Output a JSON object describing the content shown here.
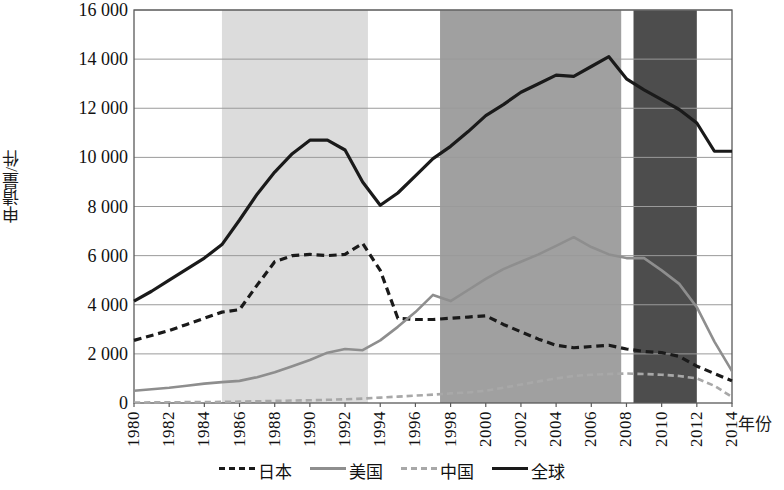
{
  "chart_data": {
    "type": "line",
    "title": "",
    "xlabel": "年份",
    "ylabel": "申请量/件",
    "xlim": [
      1980,
      2014
    ],
    "ylim": [
      0,
      16000
    ],
    "grid": true,
    "legend_position": "bottom",
    "ytick_labels": [
      "16 000",
      "14 000",
      "12 000",
      "10 000",
      "8 000",
      "6 000",
      "4 000",
      "2 000",
      "0"
    ],
    "ytick_values": [
      16000,
      14000,
      12000,
      10000,
      8000,
      6000,
      4000,
      2000,
      0
    ],
    "xtick_labels": [
      "1980",
      "1982",
      "1984",
      "1986",
      "1988",
      "1990",
      "1992",
      "1994",
      "1996",
      "1998",
      "2000",
      "2002",
      "2004",
      "2006",
      "2008",
      "2010",
      "2012",
      "2014"
    ],
    "xtick_values": [
      1980,
      1982,
      1984,
      1986,
      1988,
      1990,
      1992,
      1994,
      1996,
      1998,
      2000,
      2002,
      2004,
      2006,
      2008,
      2010,
      2012,
      2014
    ],
    "x": [
      1980,
      1981,
      1982,
      1983,
      1984,
      1985,
      1986,
      1987,
      1988,
      1989,
      1990,
      1991,
      1992,
      1993,
      1994,
      1995,
      1996,
      1997,
      1998,
      1999,
      2000,
      2001,
      2002,
      2003,
      2004,
      2005,
      2006,
      2007,
      2008,
      2009,
      2010,
      2011,
      2012,
      2013,
      2014
    ],
    "series": [
      {
        "name": "全球",
        "label": "全球",
        "style": "solid",
        "color": "#1a1a1a",
        "width": 3.2,
        "values": [
          4150,
          4550,
          5000,
          5450,
          5900,
          6450,
          7450,
          8500,
          9400,
          10150,
          10700,
          10700,
          10300,
          9000,
          8050,
          8550,
          9250,
          9950,
          10450,
          11050,
          11700,
          12150,
          12650,
          13000,
          13350,
          13300,
          13700,
          14100,
          13200,
          12750,
          12350,
          11950,
          11400,
          10250,
          10250
        ]
      },
      {
        "name": "日本",
        "label": "日本",
        "style": "dashed",
        "color": "#1a1a1a",
        "width": 3.2,
        "values": [
          2550,
          2750,
          2950,
          3200,
          3450,
          3700,
          3800,
          4800,
          5750,
          6000,
          6050,
          6000,
          6050,
          6500,
          5400,
          3450,
          3400,
          3400,
          3450,
          3500,
          3550,
          3200,
          2900,
          2600,
          2350,
          2250,
          2300,
          2350,
          2200,
          2100,
          2050,
          1900,
          1500,
          1200,
          900
        ]
      },
      {
        "name": "美国",
        "label": "美国",
        "style": "solid",
        "color": "#8e8e8e",
        "width": 2.6,
        "values": [
          500,
          560,
          620,
          700,
          790,
          850,
          900,
          1050,
          1250,
          1500,
          1750,
          2050,
          2200,
          2150,
          2550,
          3100,
          3700,
          4400,
          4150,
          4600,
          5050,
          5450,
          5750,
          6050,
          6400,
          6750,
          6350,
          6050,
          5900,
          5900,
          5400,
          4850,
          3900,
          2500,
          1300
        ]
      },
      {
        "name": "中国",
        "label": "中国",
        "style": "dashed",
        "color": "#a8a8a8",
        "width": 2.6,
        "values": [
          20,
          25,
          30,
          35,
          40,
          45,
          55,
          70,
          85,
          100,
          110,
          130,
          150,
          180,
          220,
          260,
          300,
          340,
          390,
          430,
          500,
          620,
          750,
          880,
          1000,
          1100,
          1150,
          1180,
          1200,
          1180,
          1150,
          1100,
          1000,
          700,
          250
        ]
      }
    ],
    "shaded_bands": [
      {
        "name": "band-1",
        "x_start": 1985.0,
        "x_end": 1993.3,
        "color": "#dcdcdc"
      },
      {
        "name": "band-2",
        "x_start": 1997.4,
        "x_end": 2007.7,
        "color": "#a0a0a0"
      },
      {
        "name": "band-3",
        "x_start": 2008.4,
        "x_end": 2012.0,
        "color": "#4d4d4d"
      }
    ]
  },
  "legend": {
    "items": [
      {
        "label": "日本",
        "swatch": "dash-black"
      },
      {
        "label": "美国",
        "swatch": "solid-gray"
      },
      {
        "label": "中国",
        "swatch": "dash-gray"
      },
      {
        "label": "全球",
        "swatch": "solid-black"
      }
    ]
  }
}
